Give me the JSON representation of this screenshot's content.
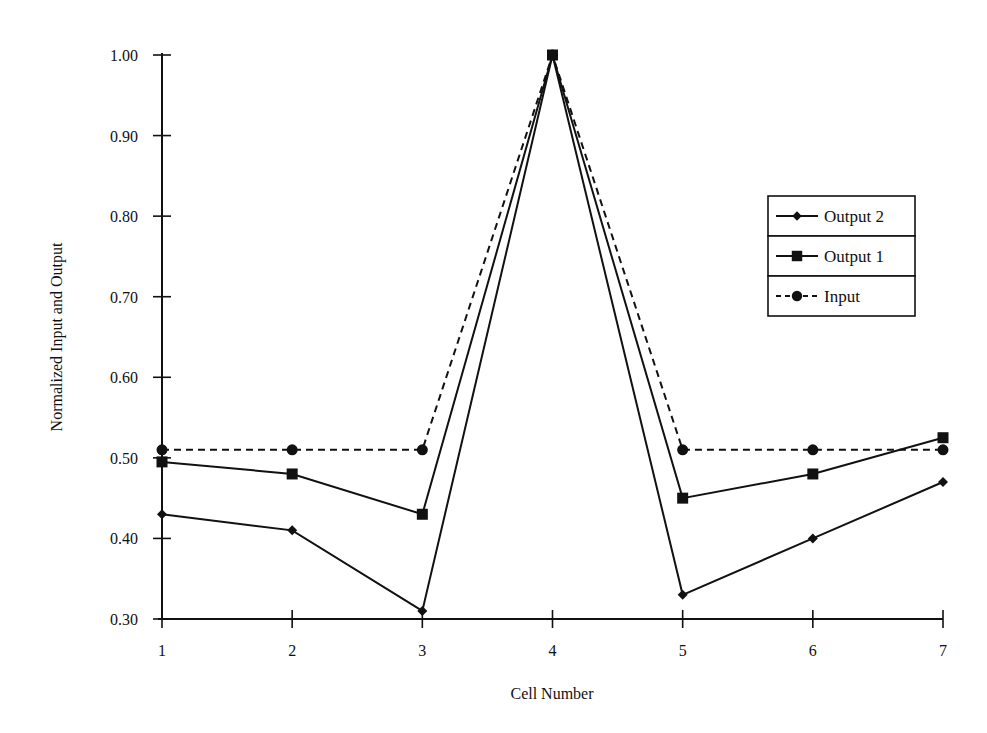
{
  "chart_data": {
    "type": "line",
    "title": "",
    "xlabel": "Cell Number",
    "ylabel": "Normalized Input and Output",
    "x": [
      1,
      2,
      3,
      4,
      5,
      6,
      7
    ],
    "xticks": [
      "1",
      "2",
      "3",
      "4",
      "5",
      "6",
      "7"
    ],
    "yticks": [
      "0.30",
      "0.40",
      "0.50",
      "0.60",
      "0.70",
      "0.80",
      "0.90",
      "1.00"
    ],
    "ylim": [
      0.3,
      1.0
    ],
    "xlim": [
      1,
      7
    ],
    "grid": false,
    "legend_position": "right, upper-middle (boxed)",
    "series": [
      {
        "name": "Output 2",
        "marker": "diamond",
        "line": "solid",
        "values": [
          0.43,
          0.41,
          0.31,
          1.0,
          0.33,
          0.4,
          0.47
        ]
      },
      {
        "name": "Output 1",
        "marker": "square",
        "line": "solid",
        "values": [
          0.495,
          0.48,
          0.43,
          1.0,
          0.45,
          0.48,
          0.525
        ]
      },
      {
        "name": "Input",
        "marker": "circle",
        "line": "dashed",
        "values": [
          0.51,
          0.51,
          0.51,
          1.0,
          0.51,
          0.51,
          0.51
        ]
      }
    ]
  },
  "legend": {
    "items": [
      {
        "label": "Output 2"
      },
      {
        "label": "Output 1"
      },
      {
        "label": "Input"
      }
    ]
  }
}
